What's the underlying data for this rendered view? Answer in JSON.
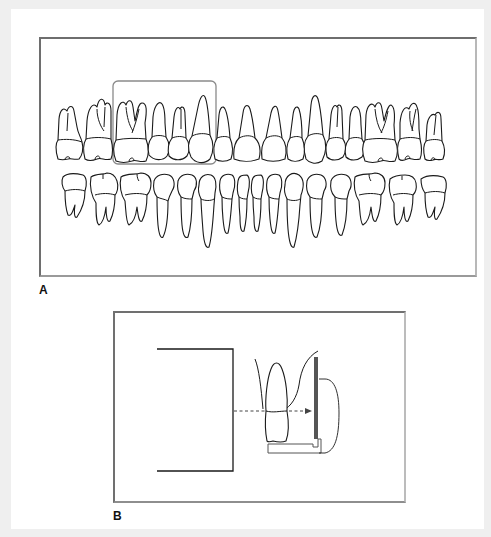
{
  "figure": {
    "panels": [
      {
        "id": "A",
        "label": "A",
        "description": "Full permanent dentition, maxillary and mandibular arches, with a highlighted region around the right maxillary first molar, premolars and canine",
        "highlight_box": {
          "color": "#8a8a8a",
          "covers": [
            "first molar",
            "second premolar",
            "first premolar",
            "canine"
          ]
        },
        "upper_arch_tooth_count": 16,
        "lower_arch_tooth_count": 16
      },
      {
        "id": "B",
        "label": "B",
        "description": "Paralleling technique: x-ray cone (PID) aimed perpendicular to a tooth and a receptor held in a holder with bite block",
        "elements": [
          "position-indicating-device",
          "central-ray-arrow",
          "tooth",
          "receptor",
          "receptor-holder",
          "bite-block"
        ]
      }
    ],
    "colors": {
      "background": "#efefef",
      "page": "#ffffff",
      "border_dark": "#6e6e6e",
      "border_light": "#b8b8b8",
      "line": "#1a1a1a",
      "receptor": "#555555"
    }
  }
}
